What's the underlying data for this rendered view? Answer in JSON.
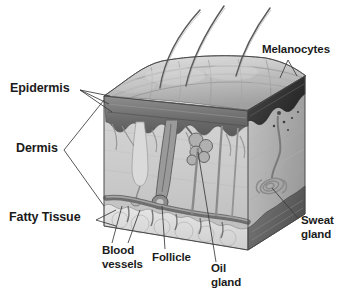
{
  "figure": {
    "type": "anatomical-diagram",
    "background_color": "#ffffff",
    "ink_color": "#1b1b1b",
    "style": "grayscale pencil/airbrush illustration of a cutaway block of skin"
  },
  "labels": {
    "epidermis": "Epidermis",
    "dermis": "Dermis",
    "fatty_tissue": "Fatty Tissue",
    "melanocytes": "Melanocytes",
    "sweat_gland_line1": "Sweat",
    "sweat_gland_line2": "gland",
    "blood_vessels_line1": "Blood",
    "blood_vessels_line2": "vessels",
    "follicle": "Follicle",
    "oil_gland_line1": "Oil",
    "oil_gland_line2": "gland"
  },
  "structures": {
    "hairs": "three hair shafts emerging from the top surface",
    "top_surface": "bumpy skin surface",
    "front_face": "cutaway dermis showing follicle, oil gland, blood vessels",
    "right_face": "cutaway showing dark epidermis band, coiled sweat gland, dark fatty tissue band"
  },
  "colors": {
    "surface_light": "#d8d8d8",
    "surface_mid": "#b4b4b4",
    "surface_dark": "#8a8a8a",
    "epidermis_band": "#6e6e6e",
    "epidermis_dark": "#3a3a3a",
    "dermis_fill": "#cfcfcf",
    "dermis_right": "#bdbdbd",
    "fat_fill": "#dcdcdc",
    "fat_dark": "#6a6a6a",
    "vessel": "#7a7a7a",
    "outline": "#4a4a4a"
  }
}
